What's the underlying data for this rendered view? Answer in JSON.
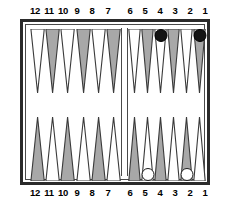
{
  "figure": {
    "kind": "backgammon-board-diagram",
    "width": 228,
    "height": 206,
    "background": "#ffffff"
  },
  "labels": {
    "top_left": [
      "12",
      "11",
      "10",
      "9",
      "8",
      "7"
    ],
    "top_right": [
      "6",
      "5",
      "4",
      "3",
      "2",
      "1"
    ],
    "bottom_left": [
      "12",
      "11",
      "10",
      "9",
      "8",
      "7"
    ],
    "bottom_right": [
      "6",
      "5",
      "4",
      "3",
      "2",
      "1"
    ]
  },
  "colors": {
    "frame": "#2b2b2b",
    "inner_frame": "#4a4a4a",
    "point_shaded": "#a8a8a8",
    "point_plain": "#ffffff",
    "point_outline": "#3a3a3a",
    "checker_black": "#141414",
    "checker_white": "#ffffff",
    "board_felt": "#ffffff"
  },
  "board": {
    "quadrants": {
      "top_left": {
        "name": "top-left-quadrant",
        "points": [
          "12",
          "11",
          "10",
          "9",
          "8",
          "7"
        ],
        "shading": [
          "plain",
          "shaded",
          "plain",
          "shaded",
          "plain",
          "shaded"
        ]
      },
      "top_right": {
        "name": "top-right-quadrant",
        "points": [
          "6",
          "5",
          "4",
          "3",
          "2",
          "1"
        ],
        "shading": [
          "plain",
          "shaded",
          "plain",
          "shaded",
          "plain",
          "shaded"
        ]
      },
      "bottom_left": {
        "name": "bottom-left-quadrant",
        "points": [
          "12",
          "11",
          "10",
          "9",
          "8",
          "7"
        ],
        "shading": [
          "shaded",
          "plain",
          "shaded",
          "plain",
          "shaded",
          "plain"
        ]
      },
      "bottom_right": {
        "name": "bottom-right-quadrant",
        "points": [
          "6",
          "5",
          "4",
          "3",
          "2",
          "1"
        ],
        "shading": [
          "shaded",
          "plain",
          "shaded",
          "plain",
          "shaded",
          "plain"
        ]
      }
    },
    "checkers": [
      {
        "color": "black",
        "quadrant": "top_right",
        "point": "4",
        "slot": 2,
        "count": 1
      },
      {
        "color": "black",
        "quadrant": "top_right",
        "point": "1",
        "slot": 5,
        "count": 1
      },
      {
        "color": "white",
        "quadrant": "bottom_right",
        "point": "5",
        "slot": 1,
        "count": 1
      },
      {
        "color": "white",
        "quadrant": "bottom_right",
        "point": "2",
        "slot": 4,
        "count": 1
      }
    ]
  },
  "caption": {
    "sliver_text": ""
  }
}
